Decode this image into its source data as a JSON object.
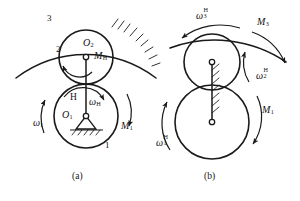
{
  "figure": {
    "stroke_color": "#1a1a1a",
    "background_color": "#ffffff"
  },
  "panels": [
    {
      "id": "a",
      "caption": "(a)",
      "description": "Planetary gear train with fixed internal ring gear 3, planet gear 2, sun gear 1 and carrier H",
      "labels": [
        {
          "name": "ring-gear-3",
          "text": "3",
          "italic": false,
          "x": 47,
          "y": 14,
          "size": 9
        },
        {
          "name": "planet-gear-2",
          "text": "2",
          "italic": false,
          "x": 56,
          "y": 45,
          "size": 9
        },
        {
          "name": "center-o2",
          "base": "O",
          "sub": "2",
          "x": 83,
          "y": 38,
          "size": 10
        },
        {
          "name": "moment-mh",
          "base": "M",
          "sub": "H",
          "x": 94,
          "y": 51,
          "size": 10
        },
        {
          "name": "carrier-h",
          "text": "H",
          "italic": false,
          "x": 70,
          "y": 93,
          "size": 9.5
        },
        {
          "name": "omega-h",
          "base": "ω",
          "sub": "H",
          "x": 89,
          "y": 97,
          "size": 10
        },
        {
          "name": "center-o1",
          "base": "O",
          "sub": "1",
          "x": 62,
          "y": 110,
          "size": 10
        },
        {
          "name": "omega-1",
          "base": "ω",
          "sub": "1",
          "x": 33,
          "y": 118,
          "size": 10
        },
        {
          "name": "moment-m1",
          "base": "M",
          "sub": "1",
          "x": 121,
          "y": 121,
          "size": 10
        },
        {
          "name": "sun-gear-1",
          "text": "1",
          "italic": false,
          "x": 105,
          "y": 141,
          "size": 9
        }
      ]
    },
    {
      "id": "b",
      "caption": "(b)",
      "description": "Inverted mechanism with carrier H held stationary; relative angular velocities carry superscript H",
      "labels": [
        {
          "name": "omega-3-h",
          "base": "ω",
          "sub": "3",
          "sup": "H",
          "x": 196,
          "y": 8,
          "size": 10
        },
        {
          "name": "moment-m3",
          "base": "M",
          "sub": "3",
          "x": 257,
          "y": 17,
          "size": 10
        },
        {
          "name": "omega-2-h",
          "base": "ω",
          "sub": "2",
          "sup": "H",
          "x": 256,
          "y": 68,
          "size": 10
        },
        {
          "name": "moment-m1-b",
          "base": "M",
          "sub": "1",
          "x": 262,
          "y": 105,
          "size": 10
        },
        {
          "name": "omega-1-h",
          "base": "ω",
          "sub": "1",
          "sup": "H",
          "x": 156,
          "y": 135,
          "size": 10
        }
      ]
    }
  ],
  "captions": [
    {
      "name": "caption-a",
      "text": "(a)",
      "x": 72,
      "y": 171
    },
    {
      "name": "caption-b",
      "text": "(b)",
      "x": 204,
      "y": 171
    }
  ],
  "geometry": {
    "panel_a": {
      "sun_gear": {
        "cx": 86,
        "cy": 116,
        "r": 32
      },
      "planet_gear": {
        "cx": 86,
        "cy": 57,
        "r": 27
      },
      "ring_arc": {
        "cx": 86,
        "cy": 132,
        "r": 116,
        "from_deg": 208,
        "to_deg": 332
      },
      "pivot_o1": {
        "cx": 86,
        "cy": 116,
        "r": 2.6
      },
      "pivot_o2": {
        "cx": 86,
        "cy": 57,
        "r": 2.6
      },
      "carrier_line": {
        "x1": 86,
        "y1": 116,
        "x2": 86,
        "y2": 57
      },
      "ground_support": true
    },
    "panel_b": {
      "sun_gear": {
        "cx": 212,
        "cy": 122,
        "r": 37
      },
      "planet_gear": {
        "cx": 212,
        "cy": 62,
        "r": 28
      },
      "ring_arc": {
        "cx": 212,
        "cy": 140,
        "r": 128,
        "from_deg": 208,
        "to_deg": 332
      },
      "pivot_lower": {
        "cx": 212,
        "cy": 122,
        "r": 2.6
      },
      "pivot_upper": {
        "cx": 212,
        "cy": 62,
        "r": 2.6
      },
      "carrier_line": {
        "x1": 212,
        "y1": 122,
        "x2": 212,
        "y2": 62
      },
      "carrier_fixed_hatch": true
    }
  }
}
